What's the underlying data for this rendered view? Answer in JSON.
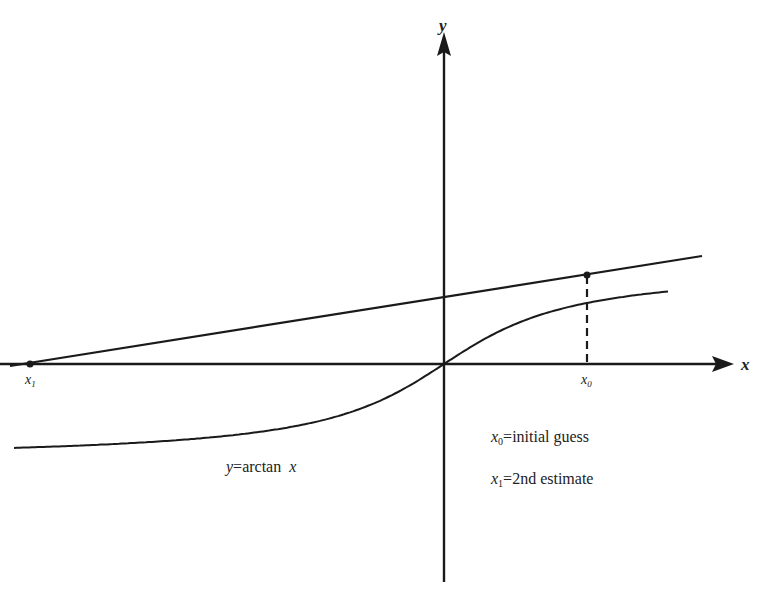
{
  "figure": {
    "axes": {
      "x_label": "x",
      "y_label": "y"
    },
    "curve": {
      "label": "y",
      "label_eq": "=",
      "label_fn": "arctan",
      "label_var": "x",
      "function": "arctan"
    },
    "points": {
      "x0": {
        "symbol": "x",
        "subscript": "0"
      },
      "x1": {
        "symbol": "x",
        "subscript": "1"
      }
    },
    "legend": [
      {
        "symbol": "x",
        "subscript": "0",
        "eq": "=",
        "text": "initial guess"
      },
      {
        "symbol": "x",
        "subscript": "1",
        "eq": "=",
        "text": "2nd estimate"
      }
    ],
    "colors": {
      "ink": "#1a1a1a",
      "background": "#ffffff"
    }
  }
}
